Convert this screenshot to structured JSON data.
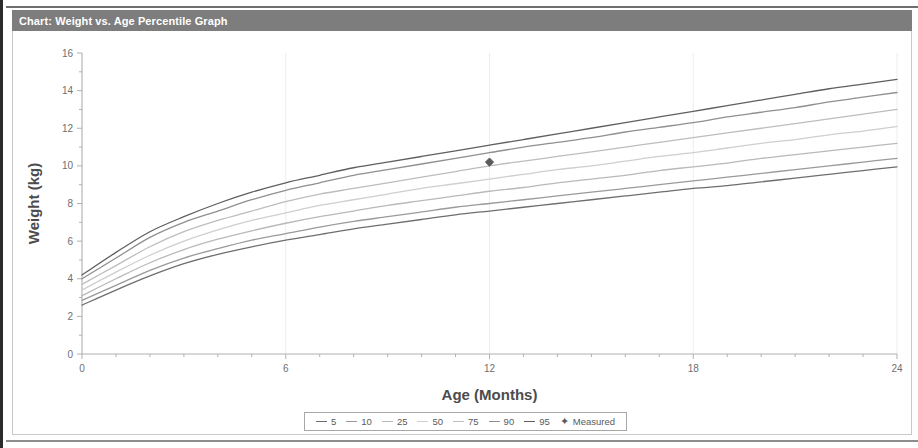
{
  "window": {
    "title": "Chart: Weight vs. Age Percentile Graph"
  },
  "legend": {
    "measured_marker_glyph": "✦",
    "items": [
      {
        "label": "5",
        "color": "#6e6e6e"
      },
      {
        "label": "10",
        "color": "#9a9a9a"
      },
      {
        "label": "25",
        "color": "#b9b9b9"
      },
      {
        "label": "50",
        "color": "#cfcfcf"
      },
      {
        "label": "75",
        "color": "#bdbdbd"
      },
      {
        "label": "90",
        "color": "#8f8f8f"
      },
      {
        "label": "95",
        "color": "#5f5f5f"
      },
      {
        "label": "Measured",
        "color": "#5a5a5a"
      }
    ]
  },
  "chart_data": {
    "type": "line",
    "title": "Chart: Weight vs. Age Percentile Graph",
    "xlabel": "Age (Months)",
    "ylabel": "Weight (kg)",
    "xlim": [
      0,
      24
    ],
    "ylim": [
      0,
      16
    ],
    "xticks": [
      0,
      6,
      12,
      18,
      24
    ],
    "yticks": [
      0,
      2,
      4,
      6,
      8,
      10,
      12,
      14,
      16
    ],
    "x_minor_tick_step": 1,
    "y_minor_tick_step": 1,
    "grid": "vertical-only-faint",
    "legend_position": "bottom-center",
    "x": [
      0,
      1,
      2,
      3,
      4,
      5,
      6,
      7,
      8,
      9,
      10,
      11,
      12,
      13,
      14,
      15,
      16,
      17,
      18,
      19,
      20,
      21,
      22,
      23,
      24
    ],
    "series": [
      {
        "name": "95",
        "color": "#5f5f5f",
        "values": [
          4.2,
          5.4,
          6.5,
          7.3,
          8.0,
          8.6,
          9.1,
          9.5,
          9.9,
          10.2,
          10.5,
          10.8,
          11.1,
          11.4,
          11.7,
          12.0,
          12.3,
          12.6,
          12.9,
          13.2,
          13.5,
          13.8,
          14.1,
          14.35,
          14.6
        ]
      },
      {
        "name": "90",
        "color": "#8f8f8f",
        "values": [
          4.0,
          5.1,
          6.2,
          7.0,
          7.6,
          8.2,
          8.7,
          9.1,
          9.5,
          9.8,
          10.1,
          10.4,
          10.7,
          11.0,
          11.25,
          11.5,
          11.8,
          12.05,
          12.3,
          12.6,
          12.85,
          13.1,
          13.4,
          13.65,
          13.9
        ]
      },
      {
        "name": "75",
        "color": "#bdbdbd",
        "values": [
          3.7,
          4.7,
          5.7,
          6.5,
          7.1,
          7.6,
          8.1,
          8.5,
          8.8,
          9.1,
          9.4,
          9.7,
          10.0,
          10.25,
          10.5,
          10.75,
          11.0,
          11.25,
          11.5,
          11.75,
          12.0,
          12.25,
          12.5,
          12.75,
          13.0
        ]
      },
      {
        "name": "50",
        "color": "#cfcfcf",
        "values": [
          3.4,
          4.35,
          5.25,
          6.0,
          6.6,
          7.1,
          7.5,
          7.9,
          8.2,
          8.5,
          8.8,
          9.05,
          9.3,
          9.55,
          9.8,
          10.0,
          10.25,
          10.5,
          10.7,
          10.95,
          11.2,
          11.4,
          11.65,
          11.85,
          12.1
        ]
      },
      {
        "name": "25",
        "color": "#b9b9b9",
        "values": [
          3.1,
          4.0,
          4.85,
          5.55,
          6.1,
          6.55,
          6.95,
          7.3,
          7.6,
          7.9,
          8.15,
          8.4,
          8.65,
          8.85,
          9.1,
          9.3,
          9.5,
          9.75,
          9.95,
          10.15,
          10.4,
          10.6,
          10.8,
          11.0,
          11.2
        ]
      },
      {
        "name": "10",
        "color": "#9a9a9a",
        "values": [
          2.85,
          3.65,
          4.45,
          5.1,
          5.6,
          6.05,
          6.4,
          6.75,
          7.05,
          7.3,
          7.55,
          7.8,
          8.0,
          8.2,
          8.4,
          8.6,
          8.8,
          9.0,
          9.2,
          9.4,
          9.6,
          9.8,
          10.0,
          10.2,
          10.4
        ]
      },
      {
        "name": "5",
        "color": "#6e6e6e",
        "values": [
          2.6,
          3.4,
          4.15,
          4.8,
          5.3,
          5.7,
          6.05,
          6.35,
          6.65,
          6.9,
          7.15,
          7.4,
          7.6,
          7.8,
          8.0,
          8.2,
          8.4,
          8.6,
          8.8,
          8.95,
          9.15,
          9.35,
          9.55,
          9.75,
          9.95
        ]
      }
    ],
    "points": [
      {
        "name": "Measured",
        "x": 12,
        "y": 10.2,
        "color": "#5a5a5a",
        "marker": "diamond"
      }
    ]
  }
}
